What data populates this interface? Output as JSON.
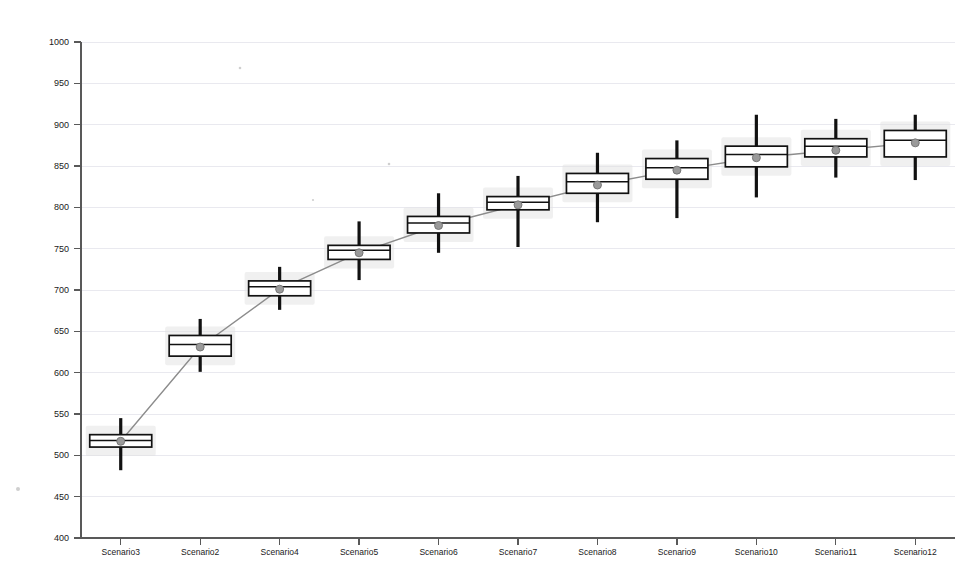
{
  "chart_data": {
    "type": "box",
    "title": "",
    "xlabel": "",
    "ylabel": "",
    "ylim": [
      400,
      1000
    ],
    "y_ticks": [
      400,
      450,
      500,
      550,
      600,
      650,
      700,
      750,
      800,
      850,
      900,
      950,
      1000
    ],
    "grid": true,
    "legend": "none",
    "categories": [
      "Scenario3",
      "Scenario2",
      "Scenario4",
      "Scenario5",
      "Scenario6",
      "Scenario7",
      "Scenario8",
      "Scenario9",
      "Scenario10",
      "Scenario11",
      "Scenario12"
    ],
    "boxes": [
      {
        "category": "Scenario3",
        "whisker_low": 482,
        "q1": 510,
        "median": 518,
        "q3": 525,
        "whisker_high": 545,
        "mean": 517
      },
      {
        "category": "Scenario2",
        "whisker_low": 601,
        "q1": 620,
        "median": 634,
        "q3": 645,
        "whisker_high": 665,
        "mean": 631
      },
      {
        "category": "Scenario4",
        "whisker_low": 676,
        "q1": 693,
        "median": 704,
        "q3": 711,
        "whisker_high": 728,
        "mean": 701
      },
      {
        "category": "Scenario5",
        "whisker_low": 712,
        "q1": 737,
        "median": 748,
        "q3": 754,
        "whisker_high": 783,
        "mean": 745
      },
      {
        "category": "Scenario6",
        "whisker_low": 745,
        "q1": 769,
        "median": 781,
        "q3": 789,
        "whisker_high": 817,
        "mean": 778
      },
      {
        "category": "Scenario7",
        "whisker_low": 752,
        "q1": 797,
        "median": 806,
        "q3": 813,
        "whisker_high": 838,
        "mean": 803
      },
      {
        "category": "Scenario8",
        "whisker_low": 782,
        "q1": 817,
        "median": 831,
        "q3": 841,
        "whisker_high": 866,
        "mean": 827
      },
      {
        "category": "Scenario9",
        "whisker_low": 787,
        "q1": 834,
        "median": 848,
        "q3": 859,
        "whisker_high": 881,
        "mean": 845
      },
      {
        "category": "Scenario10",
        "whisker_low": 812,
        "q1": 849,
        "median": 864,
        "q3": 874,
        "whisker_high": 912,
        "mean": 860
      },
      {
        "category": "Scenario11",
        "whisker_low": 836,
        "q1": 861,
        "median": 874,
        "q3": 883,
        "whisker_high": 907,
        "mean": 869
      },
      {
        "category": "Scenario12",
        "whisker_low": 833,
        "q1": 861,
        "median": 881,
        "q3": 893,
        "whisker_high": 912,
        "mean": 878
      }
    ],
    "mean_trend": {
      "name": "mean",
      "values": [
        517,
        631,
        701,
        745,
        778,
        803,
        827,
        845,
        860,
        869,
        878
      ]
    }
  }
}
